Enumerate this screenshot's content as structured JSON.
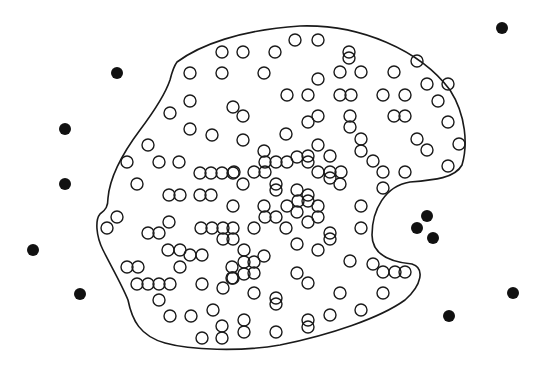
{
  "diagram": {
    "width": 546,
    "height": 376,
    "colors": {
      "stroke": "#1a1a1a",
      "filled": "#111111",
      "background": "#ffffff"
    },
    "boundary_path": "M 177 62 C 200 45, 240 30, 300 26 C 360 24, 420 50, 450 90 C 466 115, 468 145, 462 165 C 455 178, 435 180, 410 182 C 385 186, 372 210, 372 235 C 372 255, 390 262, 412 264 C 425 268, 422 285, 405 300 C 380 318, 330 335, 280 345 C 240 352, 190 350, 165 343 C 140 336, 132 320, 128 300 C 122 285, 112 268, 103 250 C 96 236, 95 220, 100 214 C 106 210, 108 206, 108 198 C 110 175, 125 150, 140 130 C 155 110, 165 95, 170 80 C 172 72, 174 66, 177 62 Z",
    "circle_radius": 6,
    "filled_radius": 6,
    "open_points": [
      [
        222,
        52
      ],
      [
        243,
        52
      ],
      [
        275,
        52
      ],
      [
        295,
        40
      ],
      [
        318,
        40
      ],
      [
        349,
        52
      ],
      [
        349,
        58
      ],
      [
        190,
        73
      ],
      [
        222,
        73
      ],
      [
        264,
        73
      ],
      [
        318,
        79
      ],
      [
        340,
        72
      ],
      [
        361,
        72
      ],
      [
        394,
        72
      ],
      [
        417,
        61
      ],
      [
        170,
        113
      ],
      [
        190,
        101
      ],
      [
        233,
        107
      ],
      [
        243,
        116
      ],
      [
        287,
        95
      ],
      [
        308,
        95
      ],
      [
        340,
        95
      ],
      [
        351,
        95
      ],
      [
        383,
        95
      ],
      [
        405,
        95
      ],
      [
        427,
        84
      ],
      [
        448,
        84
      ],
      [
        190,
        129
      ],
      [
        212,
        135
      ],
      [
        243,
        140
      ],
      [
        286,
        134
      ],
      [
        308,
        122
      ],
      [
        318,
        116
      ],
      [
        350,
        116
      ],
      [
        350,
        127
      ],
      [
        394,
        116
      ],
      [
        405,
        116
      ],
      [
        438,
        101
      ],
      [
        448,
        122
      ],
      [
        148,
        145
      ],
      [
        127,
        162
      ],
      [
        159,
        162
      ],
      [
        179,
        162
      ],
      [
        264,
        151
      ],
      [
        318,
        145
      ],
      [
        308,
        156
      ],
      [
        330,
        156
      ],
      [
        361,
        139
      ],
      [
        361,
        151
      ],
      [
        417,
        139
      ],
      [
        427,
        150
      ],
      [
        459,
        144
      ],
      [
        200,
        173
      ],
      [
        211,
        173
      ],
      [
        222,
        173
      ],
      [
        233,
        173
      ],
      [
        234,
        172
      ],
      [
        254,
        172
      ],
      [
        265,
        162
      ],
      [
        265,
        172
      ],
      [
        276,
        162
      ],
      [
        287,
        162
      ],
      [
        297,
        157
      ],
      [
        308,
        162
      ],
      [
        318,
        172
      ],
      [
        330,
        172
      ],
      [
        341,
        172
      ],
      [
        330,
        178
      ],
      [
        373,
        161
      ],
      [
        383,
        172
      ],
      [
        405,
        172
      ],
      [
        448,
        166
      ],
      [
        137,
        184
      ],
      [
        169,
        195
      ],
      [
        180,
        195
      ],
      [
        200,
        195
      ],
      [
        211,
        195
      ],
      [
        243,
        184
      ],
      [
        276,
        184
      ],
      [
        276,
        190
      ],
      [
        297,
        190
      ],
      [
        308,
        195
      ],
      [
        298,
        201
      ],
      [
        308,
        201
      ],
      [
        340,
        184
      ],
      [
        383,
        188
      ],
      [
        233,
        206
      ],
      [
        264,
        206
      ],
      [
        276,
        217
      ],
      [
        287,
        206
      ],
      [
        297,
        212
      ],
      [
        318,
        206
      ],
      [
        318,
        217
      ],
      [
        361,
        206
      ],
      [
        117,
        217
      ],
      [
        107,
        228
      ],
      [
        169,
        222
      ],
      [
        148,
        233
      ],
      [
        159,
        233
      ],
      [
        201,
        228
      ],
      [
        212,
        228
      ],
      [
        223,
        228
      ],
      [
        233,
        228
      ],
      [
        223,
        239
      ],
      [
        233,
        239
      ],
      [
        254,
        228
      ],
      [
        265,
        217
      ],
      [
        286,
        228
      ],
      [
        308,
        222
      ],
      [
        330,
        233
      ],
      [
        330,
        239
      ],
      [
        361,
        228
      ],
      [
        168,
        250
      ],
      [
        180,
        250
      ],
      [
        190,
        255
      ],
      [
        202,
        255
      ],
      [
        244,
        250
      ],
      [
        254,
        262
      ],
      [
        264,
        256
      ],
      [
        297,
        244
      ],
      [
        318,
        250
      ],
      [
        350,
        261
      ],
      [
        373,
        264
      ],
      [
        383,
        272
      ],
      [
        395,
        272
      ],
      [
        405,
        272
      ],
      [
        127,
        267
      ],
      [
        138,
        267
      ],
      [
        180,
        267
      ],
      [
        232,
        267
      ],
      [
        232,
        278
      ],
      [
        244,
        262
      ],
      [
        244,
        274
      ],
      [
        254,
        273
      ],
      [
        297,
        273
      ],
      [
        308,
        283
      ],
      [
        137,
        284
      ],
      [
        148,
        284
      ],
      [
        159,
        284
      ],
      [
        170,
        284
      ],
      [
        202,
        284
      ],
      [
        223,
        288
      ],
      [
        233,
        278
      ],
      [
        254,
        293
      ],
      [
        276,
        298
      ],
      [
        276,
        304
      ],
      [
        340,
        293
      ],
      [
        383,
        293
      ],
      [
        159,
        300
      ],
      [
        170,
        316
      ],
      [
        191,
        316
      ],
      [
        213,
        310
      ],
      [
        244,
        320
      ],
      [
        308,
        320
      ],
      [
        330,
        315
      ],
      [
        361,
        310
      ],
      [
        202,
        338
      ],
      [
        222,
        326
      ],
      [
        222,
        338
      ],
      [
        244,
        332
      ],
      [
        276,
        332
      ],
      [
        308,
        327
      ]
    ],
    "filled_points": [
      [
        117,
        73
      ],
      [
        65,
        129
      ],
      [
        65,
        184
      ],
      [
        33,
        250
      ],
      [
        80,
        294
      ],
      [
        502,
        28
      ],
      [
        427,
        216
      ],
      [
        417,
        228
      ],
      [
        433,
        238
      ],
      [
        513,
        293
      ],
      [
        449,
        316
      ]
    ]
  }
}
